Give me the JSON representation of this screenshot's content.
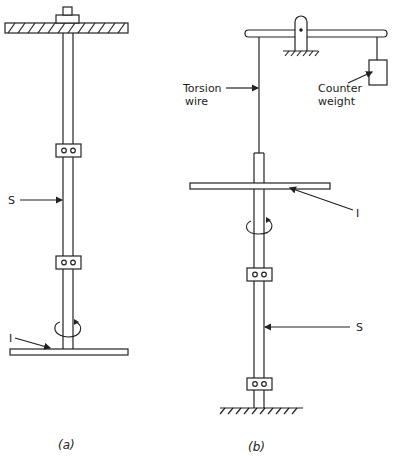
{
  "figure": {
    "panel_a": {
      "caption": "(a)",
      "labels": {
        "shaft": "S",
        "inertia": "I"
      }
    },
    "panel_b": {
      "caption": "(b)",
      "labels": {
        "torsion_line1": "Torsion",
        "torsion_line2": "wire",
        "counter_line1": "Counter",
        "counter_line2": "weight",
        "inertia": "I",
        "shaft": "S"
      }
    },
    "colors": {
      "ink": "#222222",
      "background": "#ffffff"
    }
  }
}
